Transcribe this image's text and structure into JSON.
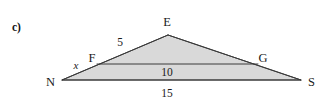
{
  "figure": {
    "part_label": "c)",
    "style": {
      "fill_color": "#d9d9d9",
      "stroke_color": "#3a3a3a",
      "text_color": "#1a1a1a",
      "background": "#ffffff"
    },
    "vertices": [
      {
        "name": "N",
        "label": "N",
        "x": 62,
        "y": 80
      },
      {
        "name": "E",
        "label": "E",
        "x": 168,
        "y": 35
      },
      {
        "name": "S",
        "label": "S",
        "x": 301,
        "y": 80
      },
      {
        "name": "F",
        "label": "F",
        "x": 97,
        "y": 64
      },
      {
        "name": "G",
        "label": "G",
        "x": 258,
        "y": 64
      }
    ],
    "segments": [
      {
        "name": "NE",
        "from": "N",
        "to": "E",
        "measure": "5"
      },
      {
        "name": "ES",
        "from": "E",
        "to": "S",
        "measure": ""
      },
      {
        "name": "NS",
        "from": "N",
        "to": "S",
        "measure": "15"
      },
      {
        "name": "FG",
        "from": "F",
        "to": "G",
        "measure": "10"
      },
      {
        "name": "NF",
        "from": "N",
        "to": "F",
        "measure": "x"
      }
    ],
    "measure_labels": [
      {
        "name": "label-5",
        "text": "5",
        "x": 120,
        "y": 37,
        "style": "measure-lbl"
      },
      {
        "name": "label-10",
        "text": "10",
        "x": 167,
        "y": 67,
        "style": "measure-lbl"
      },
      {
        "name": "label-15",
        "text": "15",
        "x": 167,
        "y": 88,
        "style": "measure-lbl"
      },
      {
        "name": "label-x",
        "text": "x",
        "x": 76,
        "y": 60,
        "style": "italic-lbl"
      }
    ],
    "vertex_labels": [
      {
        "name": "vertex-label-E",
        "text": "E",
        "x": 167,
        "y": 16
      },
      {
        "name": "vertex-label-N",
        "text": "N",
        "x": 46,
        "y": 76
      },
      {
        "name": "vertex-label-S",
        "text": "S",
        "x": 308,
        "y": 76
      },
      {
        "name": "vertex-label-F",
        "text": "F",
        "x": 92,
        "y": 52
      },
      {
        "name": "vertex-label-G",
        "text": "G",
        "x": 263,
        "y": 52
      }
    ]
  }
}
